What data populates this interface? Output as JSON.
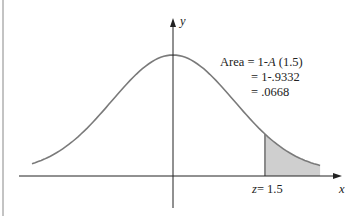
{
  "chart_data": {
    "type": "area",
    "title": "",
    "xlabel": "x",
    "ylabel": "y",
    "shaded_region": {
      "from_z": 1.5,
      "to_z": "infinity"
    },
    "annotation": {
      "line1_prefix": "Area",
      "line1": "= 1-",
      "line1_func": "A",
      "line1_arg": "(1.5)",
      "line2": "= 1-.9332",
      "line3": "= .0668"
    },
    "z_label_var": "z",
    "z_label_value": "= 1.5",
    "area_value": 0.0668,
    "cdf_value": 0.9332,
    "z": 1.5
  },
  "colors": {
    "curve": "#7a7a7a",
    "shade": "#cfcfcf",
    "axis": "#222222"
  }
}
